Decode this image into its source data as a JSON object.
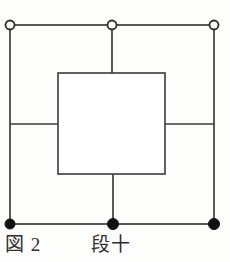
{
  "figure": {
    "caption_number": "図 2",
    "caption_label": "段十",
    "ink_color": "#3b3b3b",
    "node_fill_open": "#ffffff",
    "node_fill_closed": "#111111",
    "background_color": "#fdfdfc"
  },
  "chart_data": {
    "type": "diagram",
    "title": "図 2",
    "subtitle": "段十",
    "canvas": {
      "width": 230,
      "height": 262
    },
    "outer_square": {
      "x": 10,
      "y": 25,
      "width": 204,
      "height": 199
    },
    "inner_square": {
      "x": 58,
      "y": 73,
      "width": 107,
      "height": 101
    },
    "connectors": [
      {
        "name": "top-middle-stem",
        "x1": 112,
        "y1": 25,
        "x2": 112,
        "y2": 73
      },
      {
        "name": "bottom-middle-stem",
        "x1": 113,
        "y1": 174,
        "x2": 113,
        "y2": 224
      },
      {
        "name": "left-middle-arm",
        "x1": 10,
        "y1": 124,
        "x2": 58,
        "y2": 124
      },
      {
        "name": "right-middle-arm",
        "x1": 165,
        "y1": 124,
        "x2": 214,
        "y2": 124
      }
    ],
    "nodes": [
      {
        "name": "top-left-node",
        "cx": 10,
        "cy": 25,
        "style": "open",
        "r": 4.5
      },
      {
        "name": "top-middle-node",
        "cx": 112,
        "cy": 25,
        "style": "open",
        "r": 4.5
      },
      {
        "name": "top-right-node",
        "cx": 214,
        "cy": 25,
        "style": "open",
        "r": 4.5
      },
      {
        "name": "bottom-left-node",
        "cx": 10,
        "cy": 224,
        "style": "filled",
        "r": 5
      },
      {
        "name": "bottom-middle-node",
        "cx": 113,
        "cy": 224,
        "style": "filled",
        "r": 5.5
      },
      {
        "name": "bottom-right-node",
        "cx": 214,
        "cy": 224,
        "style": "filled",
        "r": 5.5
      }
    ],
    "node_legend": {
      "open": "open circle node (top row)",
      "filled": "filled circle node (bottom row)"
    }
  }
}
